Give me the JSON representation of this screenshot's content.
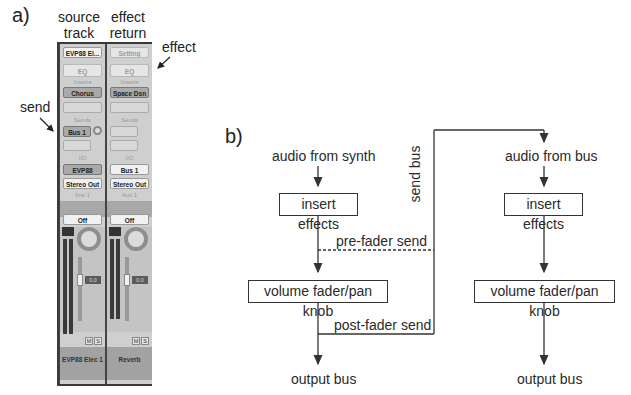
{
  "panel_a": {
    "label": "a)",
    "columns": [
      {
        "line1": "source",
        "line2": "track"
      },
      {
        "line1": "effect",
        "line2": "return"
      }
    ],
    "annotations": {
      "effect": "effect",
      "send": "send"
    },
    "strips": [
      {
        "setting": "EVP88 El...",
        "eq": "EQ",
        "inserts_label": "Inserts",
        "insert1": "Chorus",
        "sends_label": "Sends",
        "send1": "Bus 1",
        "io_label": "I/O",
        "input": "EVP88",
        "output": "Stereo Out",
        "group": "Inst 1",
        "automation": "Off",
        "fader_value": "0.0",
        "mute": "M",
        "solo": "S",
        "name": "EVP88 Elec 1"
      },
      {
        "setting": "Setting",
        "eq": "EQ",
        "inserts_label": "Inserts",
        "insert1": "Space Dsn",
        "sends_label": "Sends",
        "send1": "",
        "io_label": "I/O",
        "input": "Bus 1",
        "output": "Stereo Out",
        "group": "Aux 1",
        "automation": "Off",
        "fader_value": "0.0",
        "mute": "M",
        "solo": "S",
        "link": "⊙",
        "name": "Reverb"
      }
    ]
  },
  "panel_b": {
    "label": "b)",
    "left_chain": {
      "input": "audio from synth",
      "insert_box": "insert effects",
      "pre_fader": "pre-fader send",
      "fader_box": "volume fader/pan knob",
      "post_fader": "post-fader send",
      "output": "output bus"
    },
    "send_bus": "send bus",
    "right_chain": {
      "input": "audio from bus",
      "insert_box": "insert effects",
      "fader_box": "volume fader/pan knob",
      "output": "output bus"
    }
  }
}
